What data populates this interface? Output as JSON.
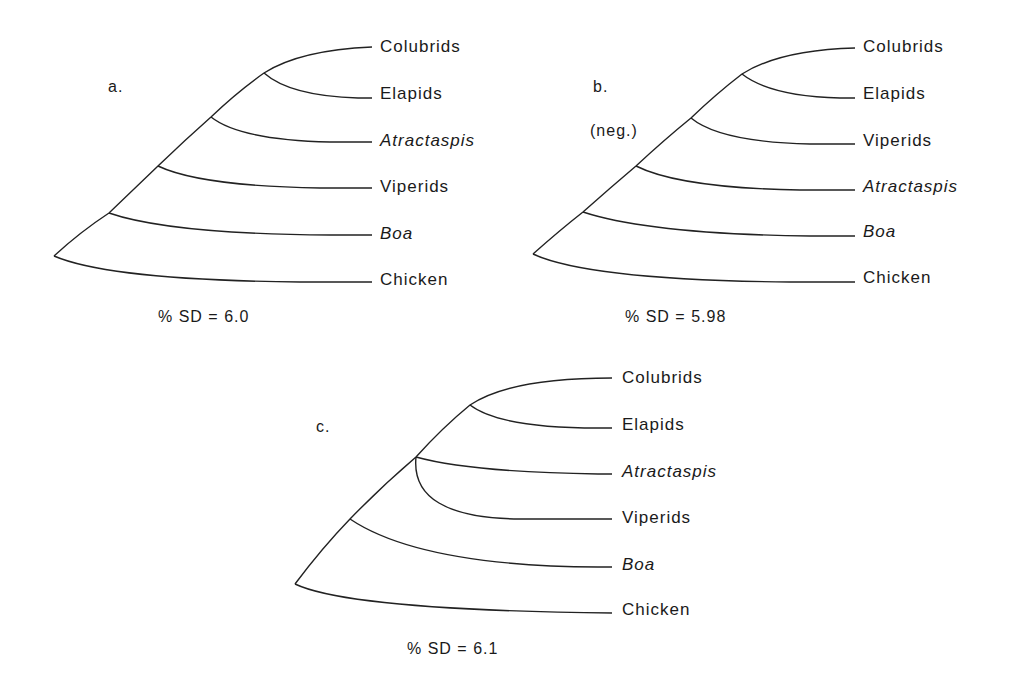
{
  "figure": {
    "trees": [
      {
        "panel": "a.",
        "note": "",
        "sd_label": "% SD = 6.0",
        "taxa": [
          "Colubrids",
          "Elapids",
          "Atractaspis",
          "Viperids",
          "Boa",
          "Chicken"
        ],
        "italic": [
          false,
          false,
          true,
          false,
          true,
          false
        ],
        "topology": "(((((Colubrids,Elapids),Atractaspis),Viperids),Boa),Chicken)"
      },
      {
        "panel": "b.",
        "note": "(neg.)",
        "sd_label": "% SD = 5.98",
        "taxa": [
          "Colubrids",
          "Elapids",
          "Viperids",
          "Atractaspis",
          "Boa",
          "Chicken"
        ],
        "italic": [
          false,
          false,
          false,
          true,
          true,
          false
        ],
        "topology": "(((((Colubrids,Elapids),Viperids),Atractaspis),Boa),Chicken)"
      },
      {
        "panel": "c.",
        "note": "",
        "sd_label": "% SD = 6.1",
        "taxa": [
          "Colubrids",
          "Elapids",
          "Atractaspis",
          "Viperids",
          "Boa",
          "Chicken"
        ],
        "italic": [
          false,
          false,
          true,
          false,
          true,
          false
        ],
        "topology": "((((Colubrids,Elapids),Atractaspis,Viperids),Boa),Chicken)"
      }
    ]
  }
}
